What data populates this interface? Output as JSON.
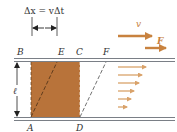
{
  "diagram": {
    "title_formula": "Δx = vΔt",
    "points": {
      "B": "B",
      "E": "E",
      "C": "C",
      "F": "F",
      "A": "A",
      "D": "D"
    },
    "length_label": "ℓ",
    "velocity_label": "v",
    "force_label": "F",
    "colors": {
      "fluid_fill": "#b8733a",
      "arrow": "#c8823f",
      "plate": "#7a7f86",
      "text": "#333333"
    },
    "profile_arrow_count": 6
  }
}
